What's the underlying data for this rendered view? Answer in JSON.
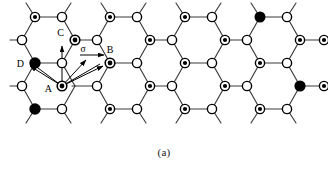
{
  "figure": {
    "caption": "(a)",
    "type": "honeycomb-lattice-diagram",
    "background_color": "#ffffff",
    "line_color": "#3a3a3a",
    "node_fill_open": "#ffffff",
    "node_stroke": "#000000",
    "node_fill_solid": "#000000",
    "arrow_color": "#000000"
  },
  "labels": {
    "site_a": "A",
    "site_b": "B",
    "site_c": "C",
    "site_d": "D",
    "vector_sigma": "σ"
  },
  "lattice": {
    "columns": 4,
    "rows": 5,
    "description": "Honeycomb (graphene-like) lattice of alternating dotted-filled and open circles connected by bonds, with dangling bonds at the top and bottom edges.",
    "dotted_node_count": 16,
    "open_node_count": 16,
    "solid_node_count": 2
  },
  "vectors": {
    "origin": "A",
    "targets": [
      "C",
      "D",
      "σ",
      "B"
    ],
    "count": 4
  }
}
